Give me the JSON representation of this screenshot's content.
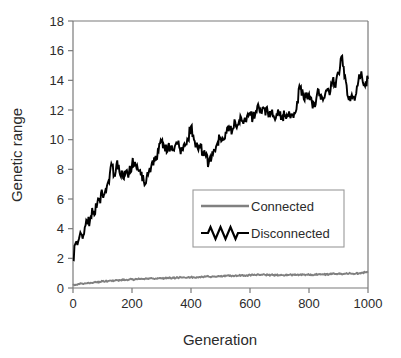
{
  "chart_data": {
    "type": "line",
    "title": "",
    "xlabel": "Generation",
    "ylabel": "Genetic range",
    "xlim": [
      0,
      1000
    ],
    "ylim": [
      0,
      18
    ],
    "xticks": [
      0,
      200,
      400,
      600,
      800,
      1000
    ],
    "yticks": [
      0,
      2,
      4,
      6,
      8,
      10,
      12,
      14,
      16,
      18
    ],
    "xtick_labels": [
      "0",
      "200",
      "400",
      "600",
      "800",
      "1000"
    ],
    "ytick_labels": [
      "0",
      "2",
      "4",
      "6",
      "8",
      "10",
      "12",
      "14",
      "16",
      "18"
    ],
    "grid": false,
    "legend_position": "center-right",
    "colors": {
      "connected": "#808080",
      "disconnected": "#000000",
      "axis": "#7a7a7a",
      "text": "#2b2b2b",
      "background": "#ffffff"
    },
    "series": [
      {
        "name": "Connected",
        "color": "#808080",
        "x": [
          0,
          10,
          20,
          30,
          40,
          50,
          60,
          70,
          80,
          90,
          100,
          110,
          120,
          130,
          140,
          150,
          160,
          170,
          180,
          190,
          200,
          210,
          220,
          230,
          240,
          250,
          260,
          270,
          280,
          290,
          300,
          310,
          320,
          330,
          340,
          350,
          360,
          370,
          380,
          390,
          400,
          410,
          420,
          430,
          440,
          450,
          460,
          470,
          480,
          490,
          500,
          510,
          520,
          530,
          540,
          550,
          560,
          570,
          580,
          590,
          600,
          610,
          620,
          630,
          640,
          650,
          660,
          670,
          680,
          690,
          700,
          710,
          720,
          730,
          740,
          750,
          760,
          770,
          780,
          790,
          800,
          810,
          820,
          830,
          840,
          850,
          860,
          870,
          880,
          890,
          900,
          910,
          920,
          930,
          940,
          950,
          960,
          970,
          980,
          990,
          1000
        ],
        "values": [
          0.18,
          0.22,
          0.27,
          0.3,
          0.32,
          0.35,
          0.36,
          0.38,
          0.4,
          0.42,
          0.45,
          0.46,
          0.48,
          0.5,
          0.5,
          0.52,
          0.53,
          0.54,
          0.55,
          0.57,
          0.58,
          0.58,
          0.6,
          0.6,
          0.61,
          0.62,
          0.63,
          0.63,
          0.64,
          0.65,
          0.66,
          0.66,
          0.67,
          0.68,
          0.68,
          0.69,
          0.7,
          0.71,
          0.7,
          0.72,
          0.73,
          0.72,
          0.74,
          0.75,
          0.74,
          0.76,
          0.77,
          0.76,
          0.78,
          0.79,
          0.78,
          0.8,
          0.82,
          0.81,
          0.83,
          0.84,
          0.83,
          0.85,
          0.86,
          0.85,
          0.87,
          0.88,
          0.87,
          0.89,
          0.9,
          0.89,
          0.88,
          0.87,
          0.88,
          0.87,
          0.86,
          0.87,
          0.88,
          0.87,
          0.89,
          0.88,
          0.9,
          0.89,
          0.91,
          0.9,
          0.89,
          0.9,
          0.92,
          0.91,
          0.9,
          0.92,
          0.91,
          0.93,
          0.95,
          0.94,
          0.96,
          0.95,
          0.97,
          0.96,
          0.98,
          0.97,
          0.99,
          1.0,
          1.02,
          1.06,
          1.12
        ]
      },
      {
        "name": "Disconnected",
        "color": "#000000",
        "x": [
          0,
          10,
          20,
          30,
          40,
          50,
          60,
          70,
          80,
          90,
          100,
          110,
          120,
          130,
          140,
          150,
          160,
          170,
          180,
          190,
          200,
          210,
          220,
          230,
          240,
          250,
          260,
          270,
          280,
          290,
          300,
          310,
          320,
          330,
          340,
          350,
          360,
          370,
          380,
          390,
          400,
          410,
          420,
          430,
          440,
          450,
          460,
          470,
          480,
          490,
          500,
          510,
          520,
          530,
          540,
          550,
          560,
          570,
          580,
          590,
          600,
          610,
          620,
          630,
          640,
          650,
          660,
          670,
          680,
          690,
          700,
          710,
          720,
          730,
          740,
          750,
          760,
          770,
          780,
          790,
          800,
          810,
          820,
          830,
          840,
          850,
          860,
          870,
          880,
          890,
          900,
          910,
          920,
          930,
          940,
          950,
          960,
          970,
          980,
          990,
          1000
        ],
        "values": [
          1.9,
          3.1,
          3.3,
          3.6,
          4.1,
          4.3,
          4.8,
          5.2,
          5.4,
          6.0,
          6.3,
          6.6,
          7.2,
          8.4,
          7.6,
          8.6,
          7.6,
          7.4,
          7.9,
          7.8,
          8.3,
          8.5,
          8.0,
          7.6,
          7.2,
          7.5,
          8.1,
          8.6,
          8.9,
          9.2,
          9.9,
          9.5,
          9.2,
          9.6,
          9.3,
          9.8,
          9.5,
          9.3,
          9.6,
          10.0,
          10.9,
          10.0,
          9.8,
          9.5,
          9.2,
          8.9,
          8.4,
          8.8,
          9.3,
          9.8,
          10.2,
          10.0,
          10.4,
          10.8,
          10.6,
          11.2,
          11.0,
          11.5,
          11.3,
          11.6,
          11.8,
          11.5,
          11.9,
          12.2,
          11.8,
          12.1,
          11.9,
          11.7,
          11.6,
          11.7,
          11.6,
          11.6,
          11.7,
          11.6,
          11.7,
          11.8,
          12.6,
          13.5,
          13.1,
          13.0,
          13.1,
          12.5,
          12.2,
          13.4,
          12.7,
          12.8,
          13.3,
          13.0,
          14.0,
          13.5,
          14.5,
          15.6,
          14.2,
          13.0,
          12.6,
          12.9,
          13.1,
          14.4,
          14.2,
          13.6,
          14.1
        ]
      }
    ]
  },
  "legend": {
    "items": [
      {
        "label": "Connected",
        "color": "#808080",
        "style": "straight"
      },
      {
        "label": "Disconnected",
        "color": "#000000",
        "style": "zigzag"
      }
    ]
  }
}
